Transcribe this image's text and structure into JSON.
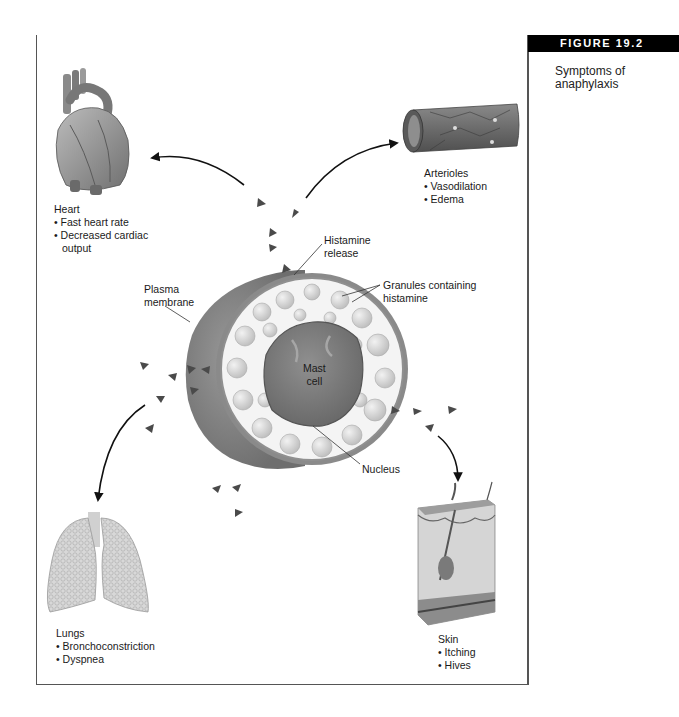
{
  "figure": {
    "number_label": "FIGURE 19.2",
    "caption": "Symptoms of anaphylaxis"
  },
  "diagram": {
    "center": {
      "cell_label": [
        "Mast",
        "cell"
      ],
      "callouts": {
        "histamine_release": [
          "Histamine",
          "release"
        ],
        "granules": [
          "Granules containing",
          "histamine"
        ],
        "plasma_membrane": [
          "Plasma",
          "membrane"
        ],
        "nucleus": "Nucleus"
      }
    },
    "organs": [
      {
        "name": "Heart",
        "symptoms": [
          "Fast heart rate",
          "Decreased cardiac",
          "output"
        ]
      },
      {
        "name": "Arterioles",
        "symptoms": [
          "Vasodilation",
          "Edema"
        ]
      },
      {
        "name": "Lungs",
        "symptoms": [
          "Bronchoconstriction",
          "Dyspnea"
        ]
      },
      {
        "name": "Skin",
        "symptoms": [
          "Itching",
          "Hives"
        ]
      }
    ]
  },
  "colors": {
    "header_black": "#000000",
    "header_gray": "#7d7d7d",
    "frame": "#555555",
    "histamine_marker": "#4a4a4a"
  }
}
